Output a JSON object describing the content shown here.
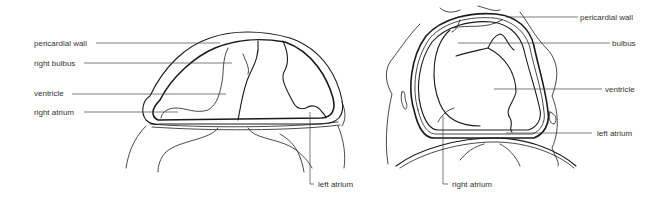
{
  "figure": {
    "panels": [
      {
        "id": "left",
        "view": "lateral section",
        "labels": [
          {
            "text": "pericardial wall",
            "side": "left"
          },
          {
            "text": "right bulbus",
            "side": "left"
          },
          {
            "text": "ventricle",
            "side": "left"
          },
          {
            "text": "right atrium",
            "side": "left"
          },
          {
            "text": "left atrium",
            "side": "bottom"
          }
        ]
      },
      {
        "id": "right",
        "view": "frontal section",
        "labels": [
          {
            "text": "pericardial wall",
            "side": "right"
          },
          {
            "text": "bulbus",
            "side": "right"
          },
          {
            "text": "ventricle",
            "side": "right"
          },
          {
            "text": "left atrium",
            "side": "right"
          },
          {
            "text": "right atrium",
            "side": "bottom"
          }
        ]
      }
    ],
    "colors": {
      "line": "#1a1a1a",
      "text": "#333333",
      "background": "#ffffff"
    }
  }
}
